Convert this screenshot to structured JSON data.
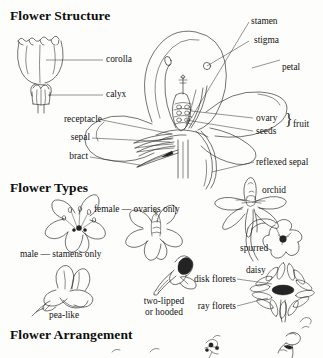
{
  "page": {
    "background_color": "#fdfdfb",
    "ink_color": "#1b1b1b",
    "style": "scanned black-and-white botanical line illustration"
  },
  "sections": [
    {
      "id": "structure",
      "heading": "Flower Structure"
    },
    {
      "id": "types",
      "heading": "Flower Types"
    },
    {
      "id": "arrangement",
      "heading": "Flower Arrangement"
    }
  ],
  "flower_structure": {
    "heading": "Flower Structure",
    "tubular_flower_labels": [
      {
        "key": "corolla",
        "text": "corolla"
      },
      {
        "key": "calyx",
        "text": "calyx"
      }
    ],
    "left_labels": [
      {
        "key": "receptacle",
        "text": "receptacle"
      },
      {
        "key": "sepal",
        "text": "sepal"
      },
      {
        "key": "bract",
        "text": "bract"
      }
    ],
    "right_labels": [
      {
        "key": "stamen",
        "text": "stamen"
      },
      {
        "key": "stigma",
        "text": "stigma"
      },
      {
        "key": "petal",
        "text": "petal"
      },
      {
        "key": "ovary",
        "text": "ovary"
      },
      {
        "key": "seeds",
        "text": "seeds"
      },
      {
        "key": "reflexed_sepal",
        "text": "reflexed sepal"
      }
    ],
    "bracket_group": {
      "text": "fruit",
      "brace": "}",
      "members": [
        "ovary",
        "seeds"
      ]
    }
  },
  "flower_types": {
    "heading": "Flower Types",
    "items": [
      {
        "key": "male",
        "text": "male — stamens only"
      },
      {
        "key": "female",
        "text": "female — ovaries only"
      },
      {
        "key": "orchid",
        "text": "orchid"
      },
      {
        "key": "spurred",
        "text": "spurred"
      },
      {
        "key": "pea_like",
        "text": "pea-like"
      },
      {
        "key": "two_lipped",
        "text": "two-lipped\nor hooded"
      },
      {
        "key": "two_lipped_line1",
        "text": "two-lipped"
      },
      {
        "key": "two_lipped_line2",
        "text": "or hooded"
      },
      {
        "key": "daisy",
        "text": "daisy"
      },
      {
        "key": "disk_florets",
        "text": "disk florets"
      },
      {
        "key": "ray_florets",
        "text": "ray florets"
      }
    ]
  },
  "flower_arrangement": {
    "heading": "Flower Arrangement",
    "note": "section cropped at bottom edge of image; only partial flower sketches visible"
  }
}
